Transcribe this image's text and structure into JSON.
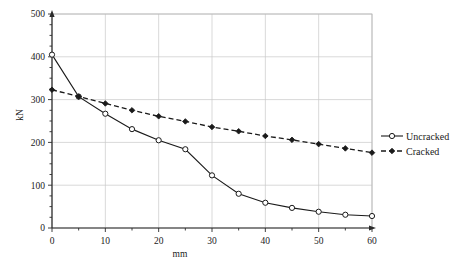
{
  "chart_data": {
    "type": "line",
    "title": "",
    "xlabel": "mm",
    "ylabel": "kN",
    "xlim": [
      0,
      60
    ],
    "ylim": [
      0,
      500
    ],
    "xticks": [
      0,
      10,
      20,
      30,
      40,
      50,
      60
    ],
    "yticks": [
      0,
      100,
      200,
      300,
      400,
      500
    ],
    "xtick_labels": [
      "0",
      "10",
      "20",
      "30",
      "40",
      "50",
      "60"
    ],
    "ytick_labels": [
      "0",
      "100",
      "200",
      "300",
      "400",
      "500"
    ],
    "x_minor_step": 5,
    "y_minor_step": 25,
    "grid": true,
    "legend_position": "right",
    "x": [
      0,
      5,
      10,
      15,
      20,
      25,
      30,
      35,
      40,
      45,
      50,
      55,
      60
    ],
    "series": [
      {
        "name": "Uncracked",
        "marker": "open-circle",
        "linestyle": "solid",
        "color": "#1a1a1a",
        "values": [
          405,
          307,
          267,
          231,
          205,
          184,
          123,
          80,
          59,
          47,
          38,
          31,
          28
        ]
      },
      {
        "name": "Cracked",
        "marker": "filled-diamond",
        "linestyle": "dashed",
        "color": "#1a1a1a",
        "values": [
          323,
          307,
          291,
          275,
          261,
          249,
          236,
          226,
          215,
          206,
          196,
          186,
          176
        ]
      }
    ]
  },
  "legend": {
    "items": [
      {
        "label": "Uncracked"
      },
      {
        "label": "Cracked"
      }
    ]
  },
  "axes": {
    "x_title": "mm",
    "y_title": "kN"
  }
}
